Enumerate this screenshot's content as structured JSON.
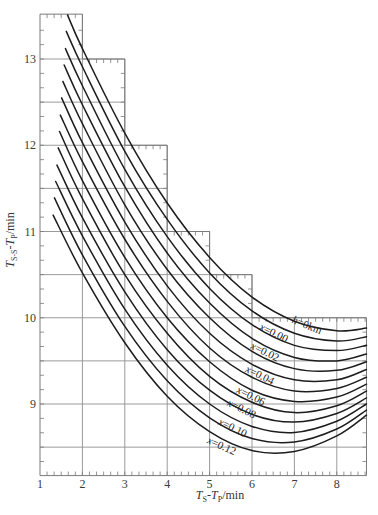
{
  "chart_data": {
    "type": "line",
    "title": "",
    "xlabel": "T_S-T_P/min",
    "ylabel": "T_{S-S}-T_P/min",
    "xlabel_parts": [
      {
        "t": "T",
        "style": "italic"
      },
      {
        "t": "S",
        "style": "sub"
      },
      {
        "t": "-",
        "style": "normal"
      },
      {
        "t": "T",
        "style": "italic"
      },
      {
        "t": "P",
        "style": "sub"
      },
      {
        "t": "/min",
        "style": "normal"
      }
    ],
    "ylabel_parts": [
      {
        "t": "T",
        "style": "italic"
      },
      {
        "t": "S-S",
        "style": "sub"
      },
      {
        "t": "-",
        "style": "normal"
      },
      {
        "t": "T",
        "style": "italic"
      },
      {
        "t": "P",
        "style": "sub"
      },
      {
        "t": "/min",
        "style": "normal"
      }
    ],
    "xlim": [
      1,
      8.7
    ],
    "ylim": [
      8.17,
      13.52
    ],
    "xticks": [
      1,
      2,
      3,
      4,
      5,
      6,
      7,
      8
    ],
    "yticks": [
      9,
      10,
      11,
      12,
      13
    ],
    "minor_tick_step": 0.1667,
    "legend": null,
    "grid": {
      "horizontal": [
        [
          13,
          1,
          3
        ],
        [
          12.5,
          1,
          3
        ],
        [
          12,
          1,
          4
        ],
        [
          11.5,
          1,
          4
        ],
        [
          11,
          1,
          5
        ],
        [
          10.5,
          1,
          6
        ],
        [
          10,
          1,
          8.7
        ],
        [
          9.5,
          1,
          8.7
        ],
        [
          9,
          1,
          8.7
        ],
        [
          8.5,
          1,
          8.7
        ]
      ],
      "vertical": [
        [
          2,
          8.17,
          13.52
        ],
        [
          3,
          8.17,
          13
        ],
        [
          4,
          8.17,
          12
        ],
        [
          5,
          8.17,
          11
        ],
        [
          6,
          8.17,
          10.5
        ],
        [
          7,
          8.17,
          10
        ],
        [
          8,
          8.17,
          10
        ]
      ]
    },
    "plot_outline": [
      [
        1,
        13.52
      ],
      [
        2,
        13.52
      ],
      [
        2,
        13
      ],
      [
        3,
        13
      ],
      [
        3,
        12
      ],
      [
        4,
        12
      ],
      [
        4,
        11
      ],
      [
        5,
        11
      ],
      [
        5,
        10.5
      ],
      [
        6,
        10.5
      ],
      [
        6,
        10
      ],
      [
        8.7,
        10
      ],
      [
        8.7,
        8.17
      ],
      [
        1,
        8.17
      ]
    ],
    "series": [
      {
        "name": "curve 1",
        "min": [
          8.1,
          9.85
        ],
        "points": [
          [
            1.65,
            13.51
          ],
          [
            2,
            13.12
          ],
          [
            3,
            12.14
          ],
          [
            4,
            11.33
          ],
          [
            5,
            10.7
          ],
          [
            6,
            10.24
          ],
          [
            7,
            9.96
          ],
          [
            8,
            9.85
          ],
          [
            8.7,
            9.88
          ]
        ]
      },
      {
        "name": "curve 2",
        "min": [
          7.97,
          9.73
        ],
        "points": [
          [
            1.62,
            13.32
          ],
          [
            2,
            12.91
          ],
          [
            3,
            11.93
          ],
          [
            4,
            11.14
          ],
          [
            5,
            10.52
          ],
          [
            6,
            10.08
          ],
          [
            7,
            9.82
          ],
          [
            8,
            9.73
          ],
          [
            8.7,
            9.78
          ]
        ]
      },
      {
        "name": "curve 3",
        "min": [
          7.85,
          9.61
        ],
        "points": [
          [
            1.6,
            13.12
          ],
          [
            2,
            12.69
          ],
          [
            3,
            11.72
          ],
          [
            4,
            10.94
          ],
          [
            5,
            10.34
          ],
          [
            6,
            9.92
          ],
          [
            7,
            9.68
          ],
          [
            8,
            9.62
          ],
          [
            8.7,
            9.68
          ]
        ]
      },
      {
        "name": "curve 4",
        "min": [
          7.72,
          9.5
        ],
        "points": [
          [
            1.57,
            12.93
          ],
          [
            2,
            12.47
          ],
          [
            3,
            11.52
          ],
          [
            4,
            10.75
          ],
          [
            5,
            10.17
          ],
          [
            6,
            9.76
          ],
          [
            7,
            9.54
          ],
          [
            8,
            9.5
          ],
          [
            8.7,
            9.58
          ]
        ]
      },
      {
        "name": "curve 5",
        "min": [
          7.6,
          9.38
        ],
        "points": [
          [
            1.54,
            12.74
          ],
          [
            2,
            12.25
          ],
          [
            3,
            11.31
          ],
          [
            4,
            10.56
          ],
          [
            5,
            10.0
          ],
          [
            6,
            9.61
          ],
          [
            7,
            9.41
          ],
          [
            8,
            9.39
          ],
          [
            8.7,
            9.49
          ]
        ]
      },
      {
        "name": "curve 6",
        "min": [
          7.47,
          9.26
        ],
        "points": [
          [
            1.51,
            12.55
          ],
          [
            2,
            12.03
          ],
          [
            3,
            11.11
          ],
          [
            4,
            10.37
          ],
          [
            5,
            9.82
          ],
          [
            6,
            9.46
          ],
          [
            7,
            9.28
          ],
          [
            8,
            9.28
          ],
          [
            8.7,
            9.4
          ]
        ]
      },
      {
        "name": "curve 7",
        "min": [
          7.35,
          9.14
        ],
        "points": [
          [
            1.48,
            12.35
          ],
          [
            2,
            11.81
          ],
          [
            3,
            10.91
          ],
          [
            4,
            10.19
          ],
          [
            5,
            9.65
          ],
          [
            6,
            9.31
          ],
          [
            7,
            9.15
          ],
          [
            8,
            9.18
          ],
          [
            8.7,
            9.31
          ]
        ]
      },
      {
        "name": "curve 8",
        "min": [
          7.22,
          9.02
        ],
        "points": [
          [
            1.46,
            12.16
          ],
          [
            2,
            11.59
          ],
          [
            3,
            10.7
          ],
          [
            4,
            10.0
          ],
          [
            5,
            9.49
          ],
          [
            6,
            9.16
          ],
          [
            7,
            9.03
          ],
          [
            8,
            9.08
          ],
          [
            8.7,
            9.23
          ]
        ]
      },
      {
        "name": "curve 9",
        "min": [
          7.09,
          8.9
        ],
        "points": [
          [
            1.43,
            11.97
          ],
          [
            2,
            11.38
          ],
          [
            3,
            10.5
          ],
          [
            4,
            9.82
          ],
          [
            5,
            9.32
          ],
          [
            6,
            9.02
          ],
          [
            7,
            8.9
          ],
          [
            8,
            8.98
          ],
          [
            8.7,
            9.15
          ]
        ]
      },
      {
        "name": "curve 10",
        "min": [
          6.97,
          8.79
        ],
        "points": [
          [
            1.4,
            11.77
          ],
          [
            2,
            11.16
          ],
          [
            3,
            10.3
          ],
          [
            4,
            9.63
          ],
          [
            5,
            9.16
          ],
          [
            6,
            8.88
          ],
          [
            7,
            8.79
          ],
          [
            8,
            8.89
          ],
          [
            8.7,
            9.07
          ]
        ]
      },
      {
        "name": "curve 11",
        "min": [
          6.84,
          8.67
        ],
        "points": [
          [
            1.37,
            11.58
          ],
          [
            2,
            10.95
          ],
          [
            3,
            10.1
          ],
          [
            4,
            9.45
          ],
          [
            5,
            9.0
          ],
          [
            6,
            8.74
          ],
          [
            7,
            8.67
          ],
          [
            8,
            8.8
          ],
          [
            8.7,
            9.0
          ]
        ]
      },
      {
        "name": "curve 12",
        "min": [
          6.72,
          8.55
        ],
        "points": [
          [
            1.34,
            11.39
          ],
          [
            2,
            10.73
          ],
          [
            3,
            9.9
          ],
          [
            4,
            9.27
          ],
          [
            5,
            8.84
          ],
          [
            6,
            8.6
          ],
          [
            7,
            8.56
          ],
          [
            8,
            8.71
          ],
          [
            8.7,
            8.93
          ]
        ]
      },
      {
        "name": "curve 13",
        "min": [
          6.59,
          8.43
        ],
        "points": [
          [
            1.31,
            11.19
          ],
          [
            2,
            10.52
          ],
          [
            3,
            9.71
          ],
          [
            4,
            9.09
          ],
          [
            5,
            8.68
          ],
          [
            6,
            8.46
          ],
          [
            7,
            8.45
          ],
          [
            8,
            8.63
          ],
          [
            8.7,
            8.87
          ]
        ]
      }
    ],
    "annotations": [
      {
        "text": "h=0km",
        "var": "h",
        "rest": "=0km",
        "x": 7.3,
        "y": 9.92,
        "rotation": 22
      },
      {
        "text": "x=0.00",
        "var": "x",
        "rest": "=0.00",
        "x": 6.52,
        "y": 9.83,
        "rotation": 26
      },
      {
        "text": "x=0.02",
        "var": "x",
        "rest": "=0.02",
        "x": 6.31,
        "y": 9.61,
        "rotation": 26
      },
      {
        "text": "x=0.04",
        "var": "x",
        "rest": "=0.04",
        "x": 6.19,
        "y": 9.34,
        "rotation": 26
      },
      {
        "text": "x=0.06",
        "var": "x",
        "rest": "=0.06",
        "x": 5.98,
        "y": 9.1,
        "rotation": 26
      },
      {
        "text": "x=0.08",
        "var": "x",
        "rest": "=0.08",
        "x": 5.76,
        "y": 8.95,
        "rotation": 26
      },
      {
        "text": "x=0.10",
        "var": "x",
        "rest": "=0.10",
        "x": 5.55,
        "y": 8.73,
        "rotation": 26
      },
      {
        "text": "x=0.12",
        "var": "x",
        "rest": "=0.12",
        "x": 5.29,
        "y": 8.52,
        "rotation": 24
      }
    ],
    "colors": {
      "curve": "#1c1c1c",
      "grid": "#8e8e8e",
      "text": "#333333"
    }
  }
}
